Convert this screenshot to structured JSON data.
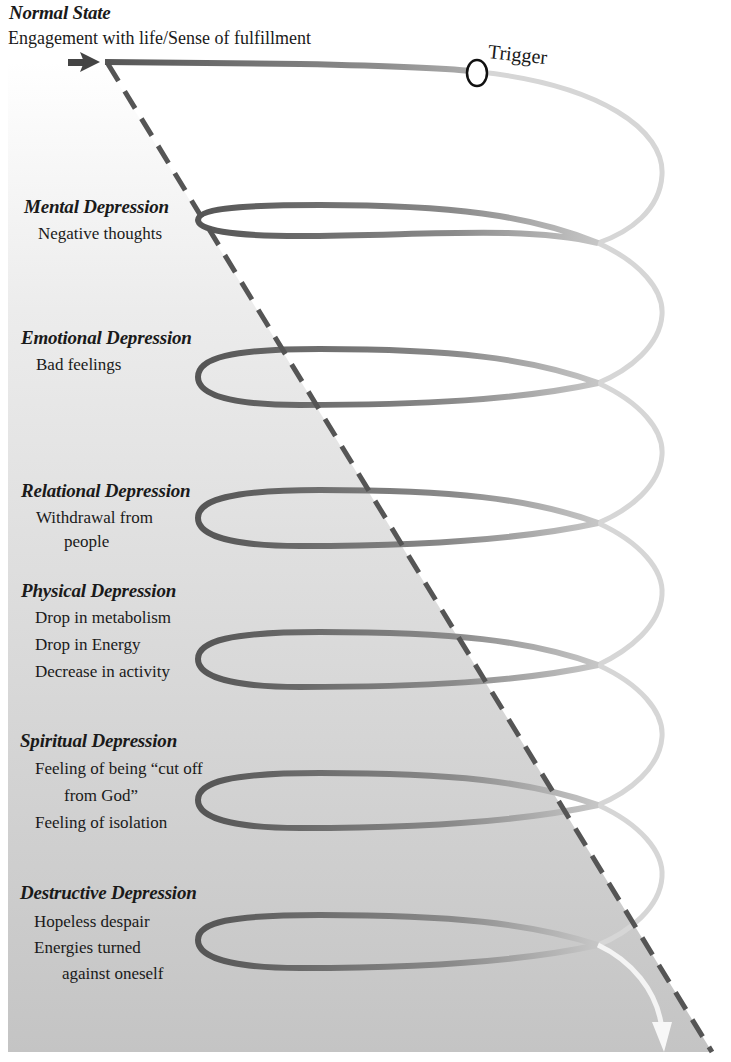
{
  "normal_state": {
    "title": "Normal State",
    "subtitle": "Engagement with life/Sense of fulfillment"
  },
  "trigger": {
    "label": "Trigger"
  },
  "stages": [
    {
      "title": "Mental Depression",
      "lines": [
        "Negative thoughts"
      ]
    },
    {
      "title": "Emotional Depression",
      "lines": [
        "Bad feelings"
      ]
    },
    {
      "title": "Relational Depression",
      "lines": [
        "Withdrawal from",
        "people"
      ]
    },
    {
      "title": "Physical Depression",
      "lines": [
        "Drop in metabolism",
        "Drop in Energy",
        "Decrease in activity"
      ]
    },
    {
      "title": "Spiritual Depression",
      "lines": [
        "Feeling of being “cut off",
        "from God”",
        "Feeling of isolation"
      ]
    },
    {
      "title": "Destructive Depression",
      "lines": [
        "Hopeless despair",
        "Energies turned",
        "against oneself"
      ]
    }
  ],
  "colors": {
    "spiral_dark": "#5a5a5a",
    "spiral_light": "#d6d6d6",
    "triangle_top": "#ffffff",
    "triangle_bottom": "#c4c4c4",
    "dashed_line": "#555555"
  }
}
